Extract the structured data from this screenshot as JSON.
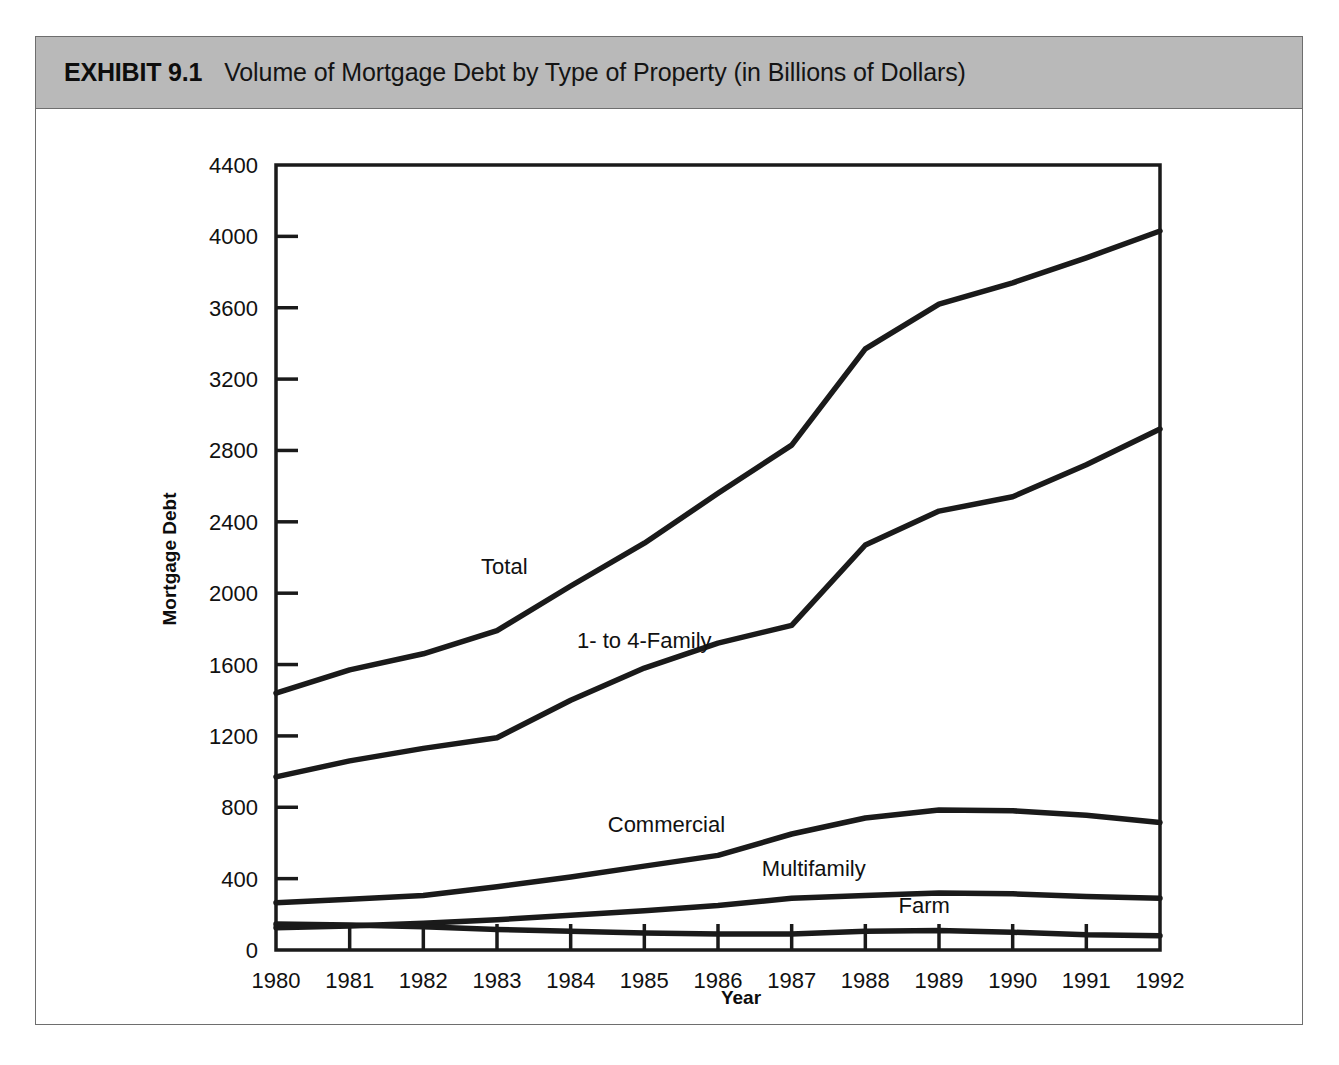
{
  "exhibit": {
    "label": "EXHIBIT 9.1",
    "title": "Volume of Mortgage Debt by Type of Property (in Billions of Dollars)",
    "header_bg": "#b9b9b9",
    "frame_border": "#6e6e6e"
  },
  "chart_data": {
    "type": "line",
    "title": "Volume of Mortgage Debt by Type of Property (in Billions of Dollars)",
    "xlabel": "Year",
    "ylabel": "Mortgage Debt",
    "x": [
      1980,
      1981,
      1982,
      1983,
      1984,
      1985,
      1986,
      1987,
      1988,
      1989,
      1990,
      1991,
      1992
    ],
    "categories": [
      "1980",
      "1981",
      "1982",
      "1983",
      "1984",
      "1985",
      "1986",
      "1987",
      "1988",
      "1989",
      "1990",
      "1991",
      "1992"
    ],
    "xlim": [
      1980,
      1992
    ],
    "ylim": [
      0,
      4400
    ],
    "yticks": [
      0,
      400,
      800,
      1200,
      1600,
      2000,
      2400,
      2800,
      3200,
      3600,
      4000,
      4400
    ],
    "ytick_labels": [
      "0",
      "400",
      "800",
      "1200",
      "1600",
      "2000",
      "2400",
      "2800",
      "3200",
      "3600",
      "4000",
      "4400"
    ],
    "grid": false,
    "legend": "inline-labels",
    "line_color": "#1a1a1a",
    "series": [
      {
        "name": "Total",
        "label": "Total",
        "values": [
          1440,
          1570,
          1660,
          1790,
          2040,
          2280,
          2560,
          2830,
          3370,
          3620,
          3740,
          3880,
          4030
        ]
      },
      {
        "name": "1- to 4-Family",
        "label": "1-  to 4-Family",
        "values": [
          970,
          1060,
          1130,
          1190,
          1400,
          1580,
          1720,
          1820,
          2270,
          2460,
          2540,
          2720,
          2920
        ]
      },
      {
        "name": "Commercial",
        "label": "Commercial",
        "values": [
          265,
          285,
          305,
          355,
          410,
          470,
          530,
          650,
          740,
          785,
          780,
          755,
          715
        ]
      },
      {
        "name": "Multifamily",
        "label": "Multifamily",
        "values": [
          125,
          135,
          150,
          170,
          195,
          220,
          250,
          290,
          305,
          320,
          315,
          300,
          290
        ]
      },
      {
        "name": "Farm",
        "label": "Farm",
        "values": [
          145,
          140,
          130,
          115,
          105,
          95,
          90,
          90,
          105,
          110,
          100,
          85,
          80
        ]
      }
    ],
    "annotations": [
      {
        "text": "Total",
        "x": 1983.1,
        "y": 2110
      },
      {
        "text": "1-  to 4-Family",
        "x": 1985.0,
        "y": 1690
      },
      {
        "text": "Commercial",
        "x": 1985.3,
        "y": 660
      },
      {
        "text": "Multifamily",
        "x": 1987.3,
        "y": 415
      },
      {
        "text": "Farm",
        "x": 1988.8,
        "y": 205
      }
    ]
  }
}
